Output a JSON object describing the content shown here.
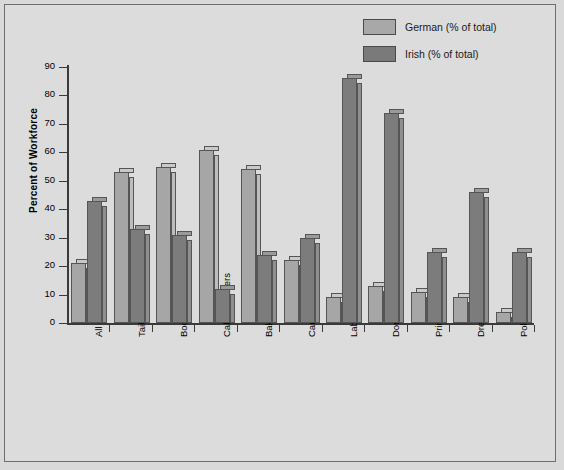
{
  "chart_data": {
    "type": "bar",
    "title": "",
    "xlabel": "",
    "ylabel": "Percent of Workforce",
    "ylim": [
      0,
      90
    ],
    "ytick_step": 10,
    "yticks": [
      0,
      10,
      20,
      30,
      40,
      50,
      60,
      70,
      80,
      90
    ],
    "grid": false,
    "legend_position": "top-right",
    "categories": [
      "All Occupations",
      "Tailors",
      "Boot and Shoemakers",
      "Cabinetmakers",
      "Bakers",
      "Carpenters",
      "Laborers",
      "Domestic Servants",
      "Printers",
      "Dressmakers",
      "Policemen"
    ],
    "series": [
      {
        "name": "German (% of total)",
        "color": "#a6a6a6",
        "values": [
          21,
          53,
          55,
          61,
          54,
          22,
          9,
          13,
          11,
          9,
          4
        ]
      },
      {
        "name": "Irish (% of total)",
        "color": "#7c7c7c",
        "values": [
          43,
          33,
          31,
          12,
          24,
          30,
          86,
          74,
          25,
          46,
          25
        ]
      }
    ]
  },
  "legend": {
    "items": [
      {
        "label": "German (% of total)",
        "swatch": "german"
      },
      {
        "label": "Irish (% of total)",
        "swatch": "irish"
      }
    ]
  },
  "colors": {
    "background": "#dcdcdc",
    "frame_border": "#6e6e6e",
    "axis": "#3a3a3a",
    "german": "#a6a6a6",
    "irish": "#7c7c7c"
  }
}
